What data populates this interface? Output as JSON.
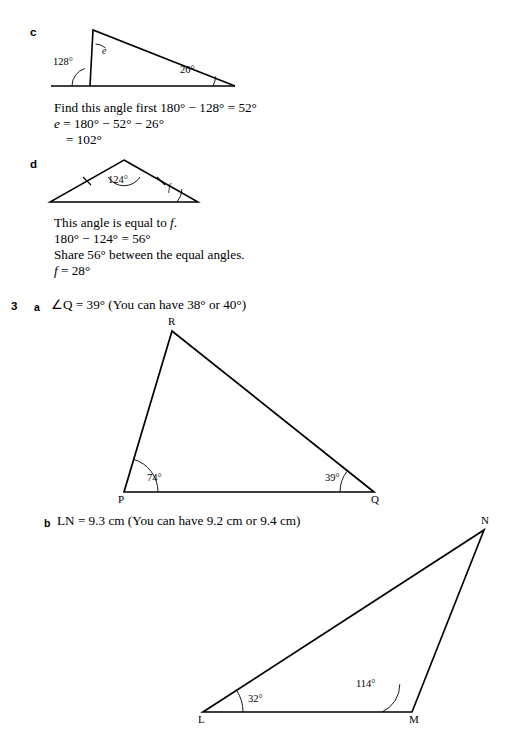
{
  "page": {
    "width": 513,
    "height": 739,
    "background": "#ffffff",
    "ink": "#000000"
  },
  "parts": {
    "c": {
      "label": "c"
    },
    "d": {
      "label": "d"
    }
  },
  "question3": {
    "number": "3",
    "part_a_label": "a",
    "part_b_label": "b",
    "part_a_answer": "∠Q = 39° (You can have 38° or 40°)",
    "part_b_answer": "LN = 9.3 cm (You can have 9.2 cm or 9.4 cm)"
  },
  "working_c": {
    "line1": "Find this angle first 180° − 128° = 52°",
    "line2_var": "e",
    "line2_rest": " = 180° − 52° − 26°",
    "line3": "= 102°"
  },
  "working_d": {
    "line1_pre": "This angle is equal to ",
    "line1_var": "f",
    "line1_post": ".",
    "line2": "180° − 124° = 56°",
    "line3": "Share 56° between the equal angles.",
    "line4_var": "f",
    "line4_rest": " = 28°"
  },
  "diagram_c": {
    "name": "triangle-c",
    "angles": {
      "exterior": "128°",
      "right_base": "26°",
      "apex_var": "e"
    }
  },
  "diagram_d": {
    "name": "triangle-d-isosceles",
    "angles": {
      "apex": "124°",
      "base_right_var": "f"
    },
    "tick_marks": 2
  },
  "diagram_pqr": {
    "name": "triangle-pqr",
    "vertices": [
      {
        "id": "P",
        "label": "P",
        "x": 124,
        "y": 492
      },
      {
        "id": "Q",
        "label": "Q",
        "x": 374,
        "y": 492
      },
      {
        "id": "R",
        "label": "R",
        "x": 172,
        "y": 331
      }
    ],
    "angles": [
      {
        "at": "P",
        "value": "74°"
      },
      {
        "at": "Q",
        "value": "39°"
      }
    ]
  },
  "diagram_lmn": {
    "name": "triangle-lmn",
    "vertices": [
      {
        "id": "L",
        "label": "L",
        "x": 203,
        "y": 712
      },
      {
        "id": "M",
        "label": "M",
        "x": 412,
        "y": 712
      },
      {
        "id": "N",
        "label": "N",
        "x": 484,
        "y": 530
      }
    ],
    "angles": [
      {
        "at": "L",
        "value": "32°"
      },
      {
        "at": "M",
        "value": "114°"
      }
    ]
  }
}
